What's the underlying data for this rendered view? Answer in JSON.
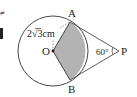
{
  "diagram": {
    "points": {
      "O": {
        "label": "O",
        "x": 53,
        "y": 51
      },
      "A": {
        "label": "A",
        "x": 70,
        "y": 22
      },
      "B": {
        "label": "B",
        "x": 70,
        "y": 80
      },
      "P": {
        "label": "P",
        "x": 121,
        "y": 51
      }
    },
    "circle": {
      "cx": 53,
      "cy": 51,
      "r": 35
    },
    "radius_label": "2√3cm",
    "radius_label_parts": {
      "coef": "2",
      "root": "3",
      "unit": "cm"
    },
    "angle_label": "60°",
    "shaded_color": "#b3b3b3",
    "line_color": "#333333"
  },
  "edge_fragments": {
    "top": "≠",
    "mid": "▌"
  }
}
